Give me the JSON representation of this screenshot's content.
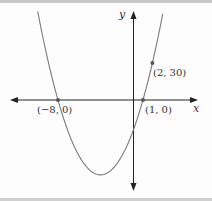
{
  "chart_data": {
    "type": "line",
    "title": "",
    "xlabel": "x",
    "ylabel": "y",
    "function": "y = 3(x+8)(x-1)",
    "series": [
      {
        "name": "parabola",
        "x": [
          -10.1,
          -8,
          -6,
          -3.5,
          -1,
          0,
          1,
          2,
          3.1
        ],
        "y": [
          71,
          0,
          -42,
          -60.75,
          -42,
          -24,
          0,
          30,
          71
        ]
      }
    ],
    "points": [
      {
        "label": "(−8, 0)",
        "x": -8,
        "y": 0
      },
      {
        "label": "(1, 0)",
        "x": 1,
        "y": 0
      },
      {
        "label": "(2, 30)",
        "x": 2,
        "y": 30
      }
    ],
    "grid": false,
    "legend": null
  },
  "labels": {
    "x_axis": "x",
    "y_axis": "y",
    "p1": "(−8, 0)",
    "p2": "(1, 0)",
    "p3": "(2, 30)"
  },
  "colors": {
    "curve": "#7a7a7a",
    "axes": "#222222",
    "points": "#555555"
  }
}
